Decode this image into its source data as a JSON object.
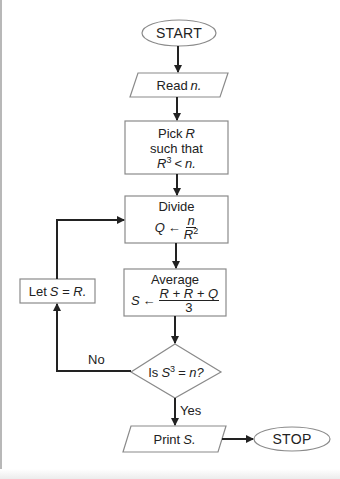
{
  "flowchart": {
    "start": {
      "label": "START"
    },
    "read": {
      "prefix": "Read",
      "var": "n."
    },
    "pick": {
      "line1_prefix": "Pick",
      "line1_var": "R",
      "line2": "such that",
      "line3_var": "R",
      "line3_exp": "3",
      "line3_op": "<",
      "line3_rhs": "n."
    },
    "divide": {
      "title": "Divide",
      "lhs": "Q",
      "arrow": "←",
      "num": "n",
      "den_var": "R",
      "den_exp": "2"
    },
    "average": {
      "title": "Average",
      "lhs": "S",
      "arrow": "←",
      "num": "R + R + Q",
      "den": "3"
    },
    "decision": {
      "prefix": "Is",
      "var": "S",
      "exp": "3",
      "rest": "= n?"
    },
    "let": {
      "prefix": "Let",
      "expr": "S = R."
    },
    "print": {
      "prefix": "Print",
      "var": "S."
    },
    "stop": {
      "label": "STOP"
    },
    "edges": {
      "no_label": "No",
      "yes_label": "Yes"
    }
  },
  "colors": {
    "shape_stroke": "#8a8a8a",
    "arrow": "#222222",
    "text": "#222222"
  }
}
